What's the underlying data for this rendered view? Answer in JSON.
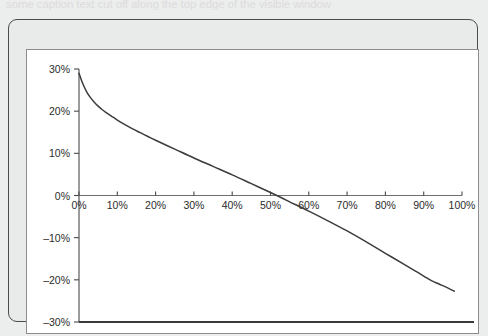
{
  "page": {
    "background_color": "#eceded",
    "clipped_header_text": "some caption text cut off along the top edge of the visible window"
  },
  "frame": {
    "border_color": "#4b4b4b",
    "panel_background": "#ffffff",
    "panel_border_color": "#8d8d8d"
  },
  "chart_data": {
    "type": "line",
    "title": "",
    "subtitle": "",
    "xlabel": "",
    "ylabel": "",
    "xlim": [
      0,
      100
    ],
    "ylim": [
      -30,
      30
    ],
    "grid": false,
    "legend": "none",
    "line_color": "#3c3c3c",
    "x_tick_labels": [
      "0%",
      "10%",
      "20%",
      "30%",
      "40%",
      "50%",
      "60%",
      "70%",
      "80%",
      "90%",
      "100%"
    ],
    "x_ticks": [
      0,
      10,
      20,
      30,
      40,
      50,
      60,
      70,
      80,
      90,
      100
    ],
    "y_tick_labels": [
      "30%",
      "20%",
      "10%",
      "0%",
      "–10%",
      "–20%",
      "–30%"
    ],
    "y_ticks": [
      30,
      20,
      10,
      0,
      -10,
      -20,
      -30
    ],
    "zero_axis": 0,
    "bottom_rule": -30,
    "series": [
      {
        "name": "curve",
        "x": [
          0,
          1,
          2,
          3,
          4,
          5,
          6,
          7,
          8,
          9,
          10,
          12,
          14,
          16,
          18,
          20,
          25,
          30,
          35,
          40,
          45,
          50,
          53,
          55,
          60,
          65,
          70,
          75,
          80,
          85,
          88,
          90,
          92,
          94,
          96,
          98
        ],
        "values": [
          29.0,
          26.5,
          24.6,
          23.2,
          22.1,
          21.2,
          20.4,
          19.7,
          19.1,
          18.5,
          17.9,
          16.8,
          15.8,
          14.9,
          14.0,
          13.1,
          11.0,
          8.9,
          6.9,
          4.9,
          2.8,
          0.7,
          -0.6,
          -1.5,
          -3.7,
          -6.0,
          -8.4,
          -11.0,
          -13.7,
          -16.4,
          -18.0,
          -19.1,
          -20.2,
          -21.0,
          -21.8,
          -22.7
        ]
      }
    ]
  }
}
